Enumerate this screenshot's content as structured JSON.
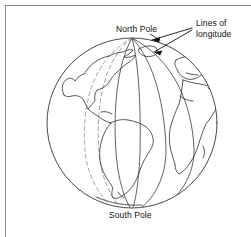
{
  "figure": {
    "kind": "globe-longitude-diagram",
    "background_color": "#ffffff",
    "line_color": "#333333",
    "frame_color": "#8a8a8a",
    "text_color": "#111111"
  },
  "labels": {
    "north_pole": "North Pole",
    "south_pole": "South Pole",
    "lines_of_longitude_line1": "Lines of",
    "lines_of_longitude_line2": "longitude"
  },
  "globe": {
    "center_x": 132,
    "center_y": 123,
    "radius_x": 85,
    "radius_y": 85,
    "top_y": 38,
    "bottom_y": 208,
    "left_x": 47,
    "right_x": 217
  },
  "meridians": {
    "solid_count": 4,
    "dashed_count": 2,
    "solid_offsets": [
      -0.18,
      0.1,
      0.38,
      0.68
    ],
    "dashed_offsets": [
      -0.62,
      -0.4
    ]
  },
  "annotations": {
    "arrow_count": 2,
    "arrow_targets": [
      "solid-meridian-near-center",
      "solid-meridian-right"
    ]
  },
  "continents": [
    "North America",
    "South America",
    "Africa",
    "Europe"
  ]
}
